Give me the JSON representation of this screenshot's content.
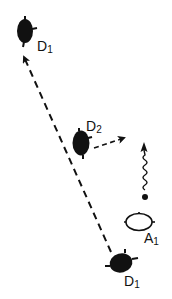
{
  "diagram": {
    "type": "cell-migration-schematic",
    "colors": {
      "ink": "#111111",
      "background": "#ffffff"
    },
    "cells": [
      {
        "id": "d1_top",
        "label_main": "D",
        "label_sub": "1",
        "fill": "filled"
      },
      {
        "id": "d2",
        "label_main": "D",
        "label_sub": "2",
        "fill": "filled"
      },
      {
        "id": "a1",
        "label_main": "A",
        "label_sub": "1",
        "fill": "outline"
      },
      {
        "id": "d1_bottom",
        "label_main": "D",
        "label_sub": "1",
        "fill": "filled"
      }
    ],
    "arrows": [
      {
        "id": "long-migration",
        "style": "dashed",
        "from": "d1_bottom",
        "to": "d1_top"
      },
      {
        "id": "d2-migration",
        "style": "dashed",
        "from": "d2",
        "direction": "right"
      },
      {
        "id": "a1-wavy",
        "style": "wavy",
        "from": "a1",
        "direction": "up",
        "has_dot": true
      }
    ]
  }
}
